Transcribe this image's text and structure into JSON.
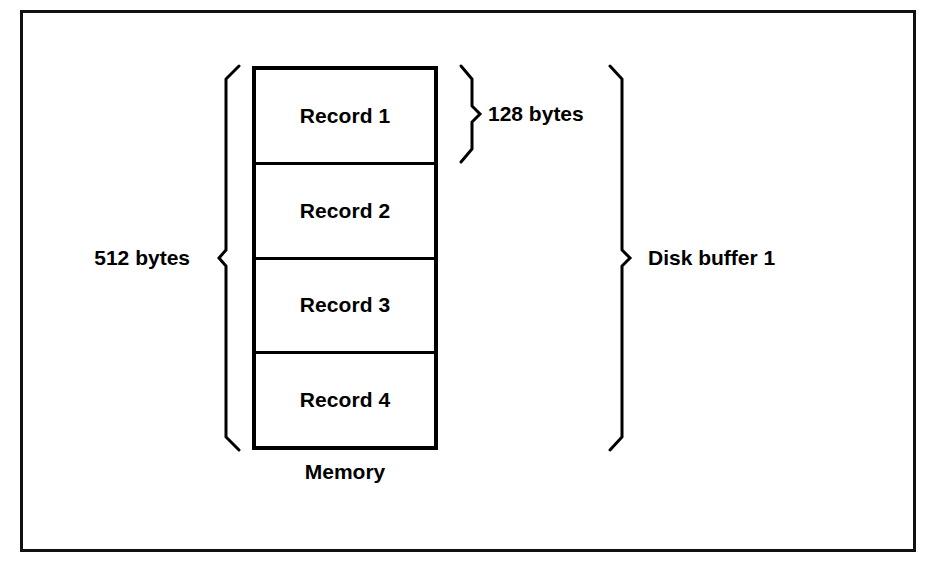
{
  "figure": {
    "memory_block": {
      "caption": "Memory",
      "records": [
        {
          "label": "Record 1"
        },
        {
          "label": "Record 2"
        },
        {
          "label": "Record 3"
        },
        {
          "label": "Record 4"
        }
      ]
    },
    "annotations": {
      "total_size": "512 bytes",
      "record_size": "128 bytes",
      "buffer": "Disk buffer 1"
    },
    "colors": {
      "background": "#ffffff",
      "stroke": "#000000",
      "frame": "#111111"
    }
  }
}
